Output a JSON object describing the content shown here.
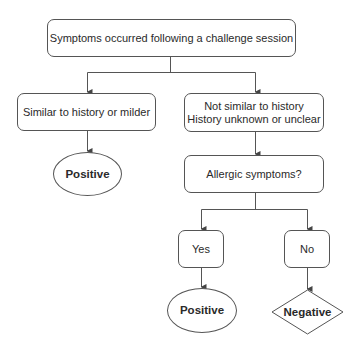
{
  "diagram": {
    "type": "flowchart",
    "nodes": {
      "root": {
        "label": "Symptoms occurred following a challenge session",
        "shape": "rounded-rect"
      },
      "similar": {
        "label": "Similar to history or milder",
        "shape": "rounded-rect"
      },
      "not_similar": {
        "line1": "Not similar to history",
        "line2": "History unknown or unclear",
        "shape": "rounded-rect"
      },
      "positive_left": {
        "label": "Positive",
        "shape": "ellipse"
      },
      "allergic": {
        "label": "Allergic symptoms?",
        "shape": "rounded-rect"
      },
      "yes": {
        "label": "Yes",
        "shape": "rounded-rect"
      },
      "no": {
        "label": "No",
        "shape": "rounded-rect"
      },
      "positive_right": {
        "label": "Positive",
        "shape": "ellipse"
      },
      "negative": {
        "label": "Negative",
        "shape": "diamond"
      }
    },
    "edges": [
      [
        "root",
        "similar"
      ],
      [
        "root",
        "not_similar"
      ],
      [
        "similar",
        "positive_left"
      ],
      [
        "not_similar",
        "allergic"
      ],
      [
        "allergic",
        "yes"
      ],
      [
        "allergic",
        "no"
      ],
      [
        "yes",
        "positive_right"
      ],
      [
        "no",
        "negative"
      ]
    ],
    "colors": {
      "stroke": "#555555",
      "text": "#2a2a2a",
      "background": "#ffffff"
    }
  }
}
